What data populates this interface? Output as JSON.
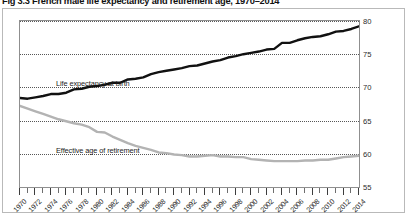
{
  "figure": {
    "title": "Fig 3.3 French male life expectancy and retirement age, 1970–2014"
  },
  "chart_data": {
    "type": "line",
    "title": "Fig 3.3 French male life expectancy and retirement age, 1970–2014",
    "xlabel": "",
    "ylabel": "",
    "xlim": [
      1970,
      2014
    ],
    "ylim": [
      55,
      80
    ],
    "yticks": [
      55,
      60,
      65,
      70,
      75,
      80
    ],
    "ytick_labels": [
      "55",
      "60",
      "65",
      "70",
      "75",
      "80"
    ],
    "ylabel_side": "right",
    "grid": "horizontal-dotted",
    "legend": "inline-annotations",
    "x": [
      1970,
      1971,
      1972,
      1973,
      1974,
      1975,
      1976,
      1977,
      1978,
      1979,
      1980,
      1981,
      1982,
      1983,
      1984,
      1985,
      1986,
      1987,
      1988,
      1989,
      1990,
      1991,
      1992,
      1993,
      1994,
      1995,
      1996,
      1997,
      1998,
      1999,
      2000,
      2001,
      2002,
      2003,
      2004,
      2005,
      2006,
      2007,
      2008,
      2009,
      2010,
      2011,
      2012,
      2013,
      2014
    ],
    "xticks_labeled": [
      "1970",
      "1972",
      "1974",
      "1976",
      "1978",
      "1980",
      "1982",
      "1984",
      "1986",
      "1988",
      "1990",
      "1992",
      "1994",
      "1996",
      "1998",
      "2000",
      "2002",
      "2004",
      "2006",
      "2008",
      "2010",
      "2012",
      "2014"
    ],
    "series": [
      {
        "name": "Life expectancy at birth",
        "color": "#111111",
        "width": 2.4,
        "annotation": "Life expectancy at birth",
        "values": [
          68.4,
          68.3,
          68.5,
          68.7,
          69.0,
          69.0,
          69.2,
          69.7,
          69.8,
          70.1,
          70.2,
          70.4,
          70.7,
          70.7,
          71.2,
          71.3,
          71.5,
          72.0,
          72.3,
          72.5,
          72.7,
          72.9,
          73.2,
          73.3,
          73.6,
          73.9,
          74.1,
          74.5,
          74.7,
          75.0,
          75.2,
          75.4,
          75.7,
          75.8,
          76.7,
          76.7,
          77.1,
          77.4,
          77.6,
          77.7,
          78.0,
          78.4,
          78.5,
          78.8,
          79.2
        ]
      },
      {
        "name": "Effective age of retirement",
        "color": "#b3b3b3",
        "width": 2.4,
        "annotation": "Effective age of retirement",
        "values": [
          67.2,
          66.8,
          66.4,
          66.0,
          65.6,
          65.2,
          64.9,
          64.6,
          64.4,
          64.0,
          63.3,
          63.2,
          62.6,
          62.1,
          61.6,
          61.2,
          60.9,
          60.6,
          60.2,
          60.1,
          59.9,
          59.8,
          59.6,
          59.6,
          59.7,
          59.8,
          59.6,
          59.6,
          59.5,
          59.5,
          59.2,
          59.1,
          59.0,
          58.9,
          58.9,
          58.9,
          58.9,
          59.0,
          59.0,
          59.1,
          59.1,
          59.3,
          59.5,
          59.6,
          59.7
        ]
      }
    ]
  }
}
